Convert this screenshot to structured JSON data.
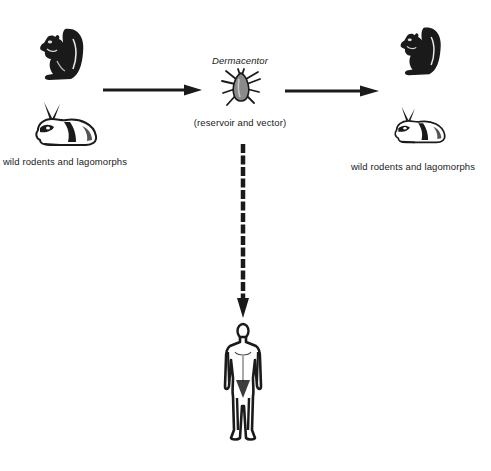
{
  "diagram": {
    "type": "transmission-cycle",
    "top_cut_text": "...",
    "left_host": {
      "label": "wild rodents and lagomorphs",
      "icons": [
        "squirrel-icon",
        "rabbit-icon"
      ]
    },
    "vector": {
      "name": "Dermacentor",
      "role": "(reservoir and vector)",
      "icon": "tick-icon"
    },
    "right_host": {
      "label": "wild rodents and lagomorphs",
      "icons": [
        "squirrel-icon",
        "rabbit-icon"
      ]
    },
    "incidental_host": {
      "icon": "human-figure-icon"
    },
    "edges": [
      {
        "from": "left_host",
        "to": "vector",
        "style": "solid"
      },
      {
        "from": "vector",
        "to": "right_host",
        "style": "solid"
      },
      {
        "from": "vector",
        "to": "incidental_host",
        "style": "dashed"
      }
    ],
    "colors": {
      "ink": "#1a1a1a",
      "background": "#ffffff",
      "tick_body": "#8a8a8a"
    }
  }
}
